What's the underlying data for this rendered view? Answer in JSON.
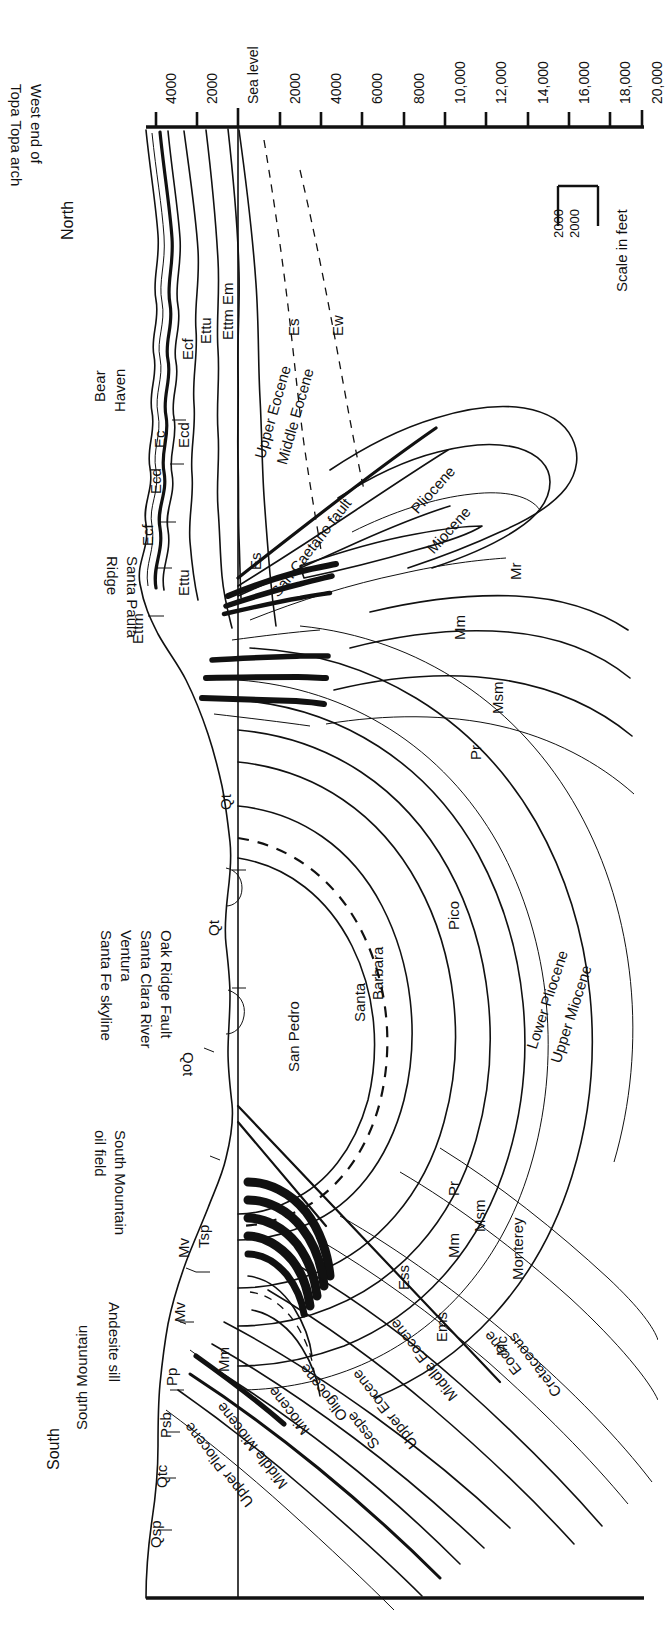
{
  "figure": {
    "type": "geologic-cross-section",
    "orientation": "rotated-90-landscape-section",
    "ends": {
      "left_end": "South",
      "right_end": "North"
    },
    "background": "#ffffff",
    "ink": "#111111"
  },
  "axis": {
    "name": "depth-elevation-axis",
    "units": "feet",
    "ticks": [
      "4000",
      "2000",
      "Sea level",
      "2000",
      "4000",
      "6000",
      "8000",
      "10,000",
      "12,000",
      "14,000",
      "16,000",
      "18,000",
      "20,000"
    ],
    "sea_level_label": "Sea level",
    "sea_level_index": 2
  },
  "scale": {
    "caption": "Scale in feet",
    "horizontal_label": "2000",
    "vertical_label": "2000"
  },
  "direction_labels": {
    "north": "North",
    "south": "South"
  },
  "place_labels": [
    {
      "id": "west-end-topa-topa-arch",
      "text": "West end of\nTopa Topa arch",
      "line1": "West end of",
      "line2": "Topa Topa arch"
    },
    {
      "id": "bear-haven",
      "text": "Bear\nHaven",
      "line1": "Bear",
      "line2": "Haven"
    },
    {
      "id": "santa-paula-ridge",
      "text": "Santa Paula\nRidge",
      "line1": "Santa Paula",
      "line2": "Ridge"
    },
    {
      "id": "santa-fe-skyline",
      "text": "Santa Fe skyline"
    },
    {
      "id": "ventura",
      "text": "Ventura"
    },
    {
      "id": "santa-clara-river",
      "text": "Santa Clara River"
    },
    {
      "id": "oak-ridge-fault",
      "text": "Oak Ridge Fault"
    },
    {
      "id": "south-mountain-oil-field",
      "line1": "South Mountain",
      "line2": "oil field"
    },
    {
      "id": "andesite-sill",
      "text": "Andesite sill"
    },
    {
      "id": "south-mountain",
      "text": "South Mountain"
    },
    {
      "id": "san-caetano-fault",
      "text": "San Caetano fault"
    }
  ],
  "formation_names": [
    {
      "id": "pliocene",
      "text": "Pliocene"
    },
    {
      "id": "miocene",
      "text": "Miocene"
    },
    {
      "id": "pico",
      "text": "Pico"
    },
    {
      "id": "santa-barbara",
      "line1": "Santa",
      "line2": "Barbara"
    },
    {
      "id": "san-pedro",
      "text": "San Pedro"
    },
    {
      "id": "lower-pliocene",
      "text": "Lower Pliocene"
    },
    {
      "id": "upper-miocene",
      "text": "Upper Miocene"
    },
    {
      "id": "monterey",
      "text": "Monterey"
    },
    {
      "id": "cretaceous",
      "text": "Cretaceous"
    },
    {
      "id": "eocene",
      "text": "Eocene"
    },
    {
      "id": "middle-eocene",
      "text": "Middle Eocene"
    },
    {
      "id": "upper-eocene",
      "text": "Upper Eocene"
    },
    {
      "id": "sespe",
      "text": "Sespe"
    },
    {
      "id": "oligocene",
      "text": "Oligocene"
    },
    {
      "id": "middle-miocene",
      "text": "Middle Miocene"
    },
    {
      "id": "upper-pliocene",
      "text": "Upper Pliocene"
    },
    {
      "id": "miocene-2",
      "text": "Miocene"
    },
    {
      "id": "upper-eocene-2",
      "text": "Upper Eocene"
    },
    {
      "id": "middle-eocene-2",
      "text": "Middle Eocene"
    }
  ],
  "unit_codes": [
    {
      "id": "ettu-1",
      "text": "Ettu"
    },
    {
      "id": "ettm-em",
      "text": "Ettm Em"
    },
    {
      "id": "ecf-1",
      "text": "Ecf"
    },
    {
      "id": "ecd-1",
      "text": "Ecd"
    },
    {
      "id": "ec",
      "text": "Ec"
    },
    {
      "id": "ecd-2",
      "text": "Ecd"
    },
    {
      "id": "ecf-2",
      "text": "Ecf"
    },
    {
      "id": "ettu-2",
      "text": "Ettu"
    },
    {
      "id": "ettm",
      "text": "Ettm"
    },
    {
      "id": "es-1",
      "text": "Es"
    },
    {
      "id": "es-2",
      "text": "Es"
    },
    {
      "id": "ew",
      "text": "Ew"
    },
    {
      "id": "mr",
      "text": "Mr"
    },
    {
      "id": "mm-1",
      "text": "Mm"
    },
    {
      "id": "msm-1",
      "text": "Msm"
    },
    {
      "id": "pr-1",
      "text": "Pr"
    },
    {
      "id": "qt-1",
      "text": "Qt"
    },
    {
      "id": "qt-2",
      "text": "Qt"
    },
    {
      "id": "qot",
      "text": "Qot"
    },
    {
      "id": "tsp",
      "text": "Tsp"
    },
    {
      "id": "mv-1",
      "text": "Mv"
    },
    {
      "id": "mv-2",
      "text": "Mv"
    },
    {
      "id": "pp",
      "text": "Pp"
    },
    {
      "id": "psb",
      "text": "Psb"
    },
    {
      "id": "qtc",
      "text": "Qtc"
    },
    {
      "id": "qsp",
      "text": "Qsp"
    },
    {
      "id": "mm-2",
      "text": "Mm"
    },
    {
      "id": "mm-3",
      "text": "Mm"
    },
    {
      "id": "msm-2",
      "text": "Msm"
    },
    {
      "id": "pr-2",
      "text": "Pr"
    },
    {
      "id": "ess",
      "text": "Ess"
    },
    {
      "id": "ems",
      "text": "Ems"
    },
    {
      "id": "mc",
      "text": "Mc"
    }
  ]
}
